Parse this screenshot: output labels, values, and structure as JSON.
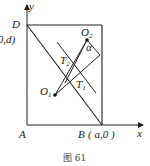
{
  "figure": {
    "caption": "图 61",
    "axes": {
      "x_label": "x",
      "y_label": "y"
    },
    "points": {
      "A": "A",
      "B": "B",
      "B_coord": "( a,0 )",
      "D": "D",
      "D_coord": "(0,d)",
      "O1": "O",
      "O1_sub": "1",
      "O2": "O",
      "O2_sub": "2",
      "T1": "T",
      "T1_sub": "1",
      "T2": "T",
      "T2_sub": "2",
      "angle": "α"
    }
  }
}
